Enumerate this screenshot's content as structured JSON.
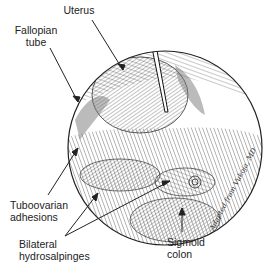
{
  "figure": {
    "labels": {
      "uterus": "Uterus",
      "fallopian_tube_line1": "Fallopian",
      "fallopian_tube_line2": "tube",
      "tuboovarian_line1": "Tuboovarian",
      "tuboovarian_line2": "adhesions",
      "bilateral_line1": "Bilateral",
      "bilateral_line2": "hydrosalpinges",
      "sigmoid_line1": "Sigmoid",
      "sigmoid_line2": "colon"
    },
    "signature": "Adapted from Vukoja, MD",
    "colors": {
      "ink": "#222222",
      "background": "#ffffff"
    }
  }
}
